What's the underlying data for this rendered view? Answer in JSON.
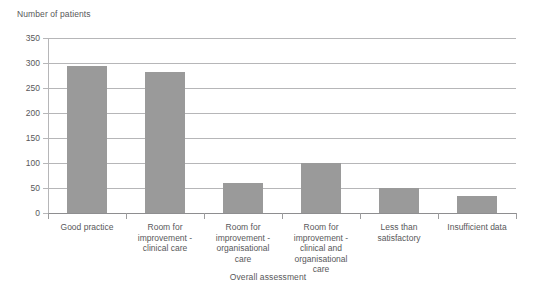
{
  "chart_data": {
    "type": "bar",
    "title": "",
    "ylabel": "Number of patients",
    "xlabel": "Overall assessment",
    "categories": [
      "Good practice",
      "Room for improvement - clinical care",
      "Room for improvement - organisational care",
      "Room for improvement - clinical and organisational care",
      "Less than satisfactory",
      "Insufficient data"
    ],
    "category_lines": [
      [
        "Good practice"
      ],
      [
        "Room for",
        "improvement -",
        "clinical care"
      ],
      [
        "Room for",
        "improvement -",
        "organisational",
        "care"
      ],
      [
        "Room for",
        "improvement -",
        "clinical and",
        "organisational",
        "care"
      ],
      [
        "Less than",
        "satisfactory"
      ],
      [
        "Insufficient data"
      ]
    ],
    "values": [
      295,
      283,
      60,
      100,
      51,
      35
    ],
    "ylim": [
      0,
      350
    ],
    "ytick_labels": [
      "0",
      "50",
      "100",
      "150",
      "200",
      "250",
      "300",
      "350"
    ],
    "ytick_values": [
      0,
      50,
      100,
      150,
      200,
      250,
      300,
      350
    ],
    "grid": true,
    "legend": "none",
    "bar_color": "#9a9a9a",
    "gridline_color": "#b6b6b8",
    "text_color": "#58585a"
  }
}
